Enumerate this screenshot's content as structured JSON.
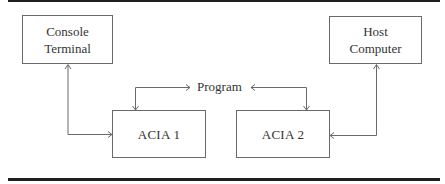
{
  "diagram": {
    "type": "block-diagram",
    "nodes": [
      {
        "id": "console",
        "label_lines": [
          "Console",
          "Terminal"
        ]
      },
      {
        "id": "host",
        "label_lines": [
          "Host",
          "Computer"
        ]
      },
      {
        "id": "acia1",
        "label_lines": [
          "ACIA 1"
        ]
      },
      {
        "id": "acia2",
        "label_lines": [
          "ACIA 2"
        ]
      },
      {
        "id": "program",
        "label_lines": [
          "Program"
        ]
      }
    ],
    "edges": [
      {
        "from": "acia1",
        "to": "console",
        "arrows": "both"
      },
      {
        "from": "acia2",
        "to": "host",
        "arrows": "both"
      },
      {
        "from": "program",
        "to": "acia1",
        "arrows": "both"
      },
      {
        "from": "program",
        "to": "acia2",
        "arrows": "both"
      }
    ]
  },
  "labels": {
    "console_line1": "Console",
    "console_line2": "Terminal",
    "host_line1": "Host",
    "host_line2": "Computer",
    "acia1": "ACIA 1",
    "acia2": "ACIA 2",
    "program": "Program"
  },
  "colors": {
    "rule": "#1e1e1e",
    "box_border": "#6a6a6a",
    "connector": "#6a6a6a",
    "text": "#333333"
  }
}
